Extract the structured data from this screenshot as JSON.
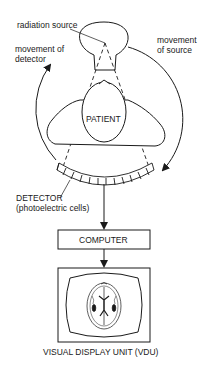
{
  "diagram": {
    "labels": {
      "radiation_source": "radiation source",
      "movement_of_source_1": "movement",
      "movement_of_source_2": "of source",
      "movement_of_detector_1": "movement of",
      "movement_of_detector_2": "detector",
      "patient": "PATIENT",
      "detector_1": "DETECTOR",
      "detector_2": "(photoelectric cells)",
      "computer": "COMPUTER",
      "vdu": "VISUAL DISPLAY UNIT (VDU)"
    },
    "detector_cell_count": 11,
    "colors": {
      "line": "#1a1a1a",
      "background": "#ffffff"
    }
  }
}
